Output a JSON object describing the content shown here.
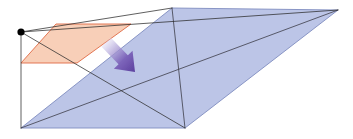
{
  "canvas": {
    "width": 353,
    "height": 139,
    "background": "#ffffff",
    "title": "Perspective projection of a plane onto a larger plane"
  },
  "colors": {
    "background": "#ffffff",
    "blue_fill": "#bcc5e7",
    "blue_stroke": "#7f8cc0",
    "orange_fill": "#f7cbb2",
    "orange_stroke": "#e06a44",
    "projection_line": "#2b2b2b",
    "apex_dot": "#000000",
    "arrow_dark": "#5b3f9e",
    "arrow_light": "#e8e4f5"
  },
  "elements": {
    "apex_point": {
      "name": "projection-center",
      "x": 21,
      "y": 32,
      "radius": 3.6
    },
    "blue_plane": {
      "name": "image-plane",
      "fill": "#bcc5e7",
      "stroke": "#7f8cc0",
      "points": "172,8 338,10 185,128 21,128"
    },
    "orange_plane": {
      "name": "source-plane",
      "fill": "#f7cbb2",
      "stroke": "#e06a44",
      "points": "56,24 131,24 77,63 21,63"
    },
    "projection_lines": [
      {
        "name": "apex-to-blue-top-left",
        "x1": 21,
        "y1": 32,
        "x2": 172,
        "y2": 8
      },
      {
        "name": "apex-to-blue-top-right",
        "x1": 21,
        "y1": 32,
        "x2": 338,
        "y2": 10
      },
      {
        "name": "apex-to-blue-bottom-right",
        "x1": 21,
        "y1": 32,
        "x2": 185,
        "y2": 128
      },
      {
        "name": "apex-to-blue-bottom-left",
        "x1": 21,
        "y1": 32,
        "x2": 21,
        "y2": 128
      }
    ],
    "blue_diagonals": [
      {
        "name": "blue-diagonal-top-left-to-bottom-right",
        "x1": 172,
        "y1": 8,
        "x2": 185,
        "y2": 128
      },
      {
        "name": "blue-diagonal-bottom-left-to-top-right",
        "x1": 21,
        "y1": 128,
        "x2": 338,
        "y2": 10
      }
    ],
    "arrow": {
      "name": "motion-arrow",
      "start_x": 106,
      "start_y": 42,
      "end_x": 135,
      "end_y": 72,
      "shaft_width": 13,
      "head_width": 26,
      "head_length": 17,
      "direction": "down-right"
    }
  }
}
